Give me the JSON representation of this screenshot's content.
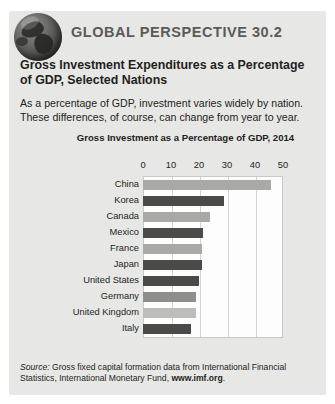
{
  "header": {
    "globe_icon": "globe-icon",
    "series_title": "GLOBAL PERSPECTIVE 30.2"
  },
  "box": {
    "title": "Gross Investment Expenditures as a Percentage of GDP, Selected Nations",
    "body": "As a percentage of GDP, investment varies widely by nation. These differences, of course, can change from year to year."
  },
  "source": {
    "lead": "Source:",
    "text": " Gross fixed capital formation data from International Financial Statistics, International Monetary Fund, ",
    "url": "www.imf.org",
    "period": "."
  },
  "colors": {
    "panel_background": "#e7e7e5",
    "plot_background": "#fdfdfd",
    "gridline": "#d2d2cf",
    "bar_light": "#a9a9a6",
    "bar_dark": "#4a4a48",
    "text": "#231f20",
    "series_title": "#5a5a57"
  },
  "chart_data": {
    "type": "bar",
    "orientation": "horizontal",
    "title": "Gross Investment as a Percentage of GDP, 2014",
    "xlabel": "",
    "ylabel": "",
    "xlim": [
      0,
      50
    ],
    "xticks": [
      0,
      10,
      20,
      30,
      40,
      50
    ],
    "xtick_labels": [
      "0",
      "10",
      "20",
      "30",
      "40",
      "50"
    ],
    "grid": true,
    "grid_axis": "x",
    "legend": false,
    "categories": [
      "China",
      "Korea",
      "Canada",
      "Mexico",
      "France",
      "Japan",
      "United States",
      "Germany",
      "United Kingdom",
      "Italy"
    ],
    "values": [
      45.7,
      29.0,
      24.0,
      21.5,
      21.0,
      21.0,
      20.0,
      19.0,
      19.0,
      17.0
    ],
    "bar_colors": [
      "#a9a9a6",
      "#4a4a48",
      "#a9a9a6",
      "#4a4a48",
      "#a9a9a6",
      "#4a4a48",
      "#4a4a48",
      "#8e8e8b",
      "#bdbdba",
      "#4a4a48"
    ]
  }
}
